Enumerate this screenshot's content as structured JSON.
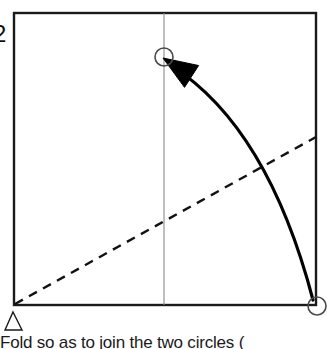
{
  "figure": {
    "number_label": "2",
    "caption": "Fold so as to join the two circles ("
  },
  "colors": {
    "outline": "#1a1a1a",
    "crease_line": "#8a8a8a",
    "fold_line": "#111111",
    "arrow": "#000000",
    "circle_stroke": "#4a4a4a",
    "background": "#ffffff"
  },
  "shapes": {
    "paper_square": {
      "name": "square paper sheet",
      "x": 14,
      "y": 13,
      "width": 302,
      "height": 292,
      "stroke_width": 2.4
    },
    "vertical_crease": {
      "name": "existing vertical crease line",
      "x": 164,
      "y1": 13,
      "y2": 305,
      "stroke_width": 1.1,
      "style": "solid"
    },
    "fold_line": {
      "name": "dashed valley fold line",
      "x1": 15,
      "y1": 304,
      "x2": 316,
      "y2": 137,
      "style": "dashed",
      "dash_pattern": "9 7",
      "stroke_width": 2.4
    },
    "circle_target": {
      "name": "destination circle on crease",
      "cx": 164,
      "cy": 57,
      "r": 9,
      "stroke_width": 1.6
    },
    "circle_source": {
      "name": "source circle at bottom right corner",
      "cx": 317,
      "cy": 306,
      "r": 9,
      "stroke_width": 1.6
    },
    "fold_arrow": {
      "name": "curved motion arrow",
      "from_x": 313,
      "from_y": 300,
      "to_x": 172,
      "to_y": 66,
      "control_x": 268,
      "control_y": 128,
      "stroke_width": 3.2
    },
    "corner_marker": {
      "name": "triangle alignment marker",
      "apex_x": 13,
      "apex_y": 312,
      "left_x": 5,
      "left_y": 330,
      "right_x": 22,
      "right_y": 330,
      "stroke_width": 1.4
    }
  }
}
